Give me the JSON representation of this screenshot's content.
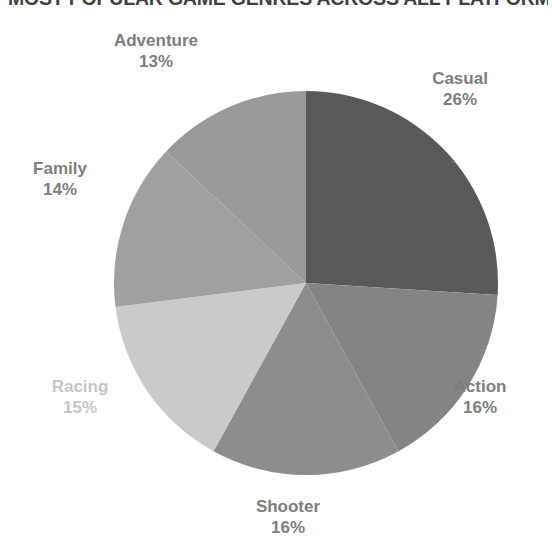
{
  "chart_data": {
    "type": "pie",
    "title": "MOST POPULAR GAME GENRES ACROSS ALL PLATFORMS",
    "xlabel": "",
    "ylabel": "",
    "legend": "none",
    "grid": false,
    "start_angle_deg": 0,
    "direction": "clockwise",
    "categories": [
      "Casual",
      "Action",
      "Shooter",
      "Racing",
      "Family",
      "Adventure"
    ],
    "values": [
      26,
      16,
      16,
      15,
      14,
      13
    ],
    "value_unit": "%",
    "slices": [
      {
        "label": "Casual",
        "value": 26,
        "display": "26%",
        "color": "#59595b",
        "label_color": "#7d7d7f"
      },
      {
        "label": "Action",
        "value": 16,
        "display": "16%",
        "color": "#848486",
        "label_color": "#7d7d7f"
      },
      {
        "label": "Shooter",
        "value": 16,
        "display": "16%",
        "color": "#8d8d8f",
        "label_color": "#7d7d7f"
      },
      {
        "label": "Racing",
        "value": 15,
        "display": "15%",
        "color": "#cacacb",
        "label_color": "#c6c6c7"
      },
      {
        "label": "Family",
        "value": 14,
        "display": "14%",
        "color": "#a0a0a2",
        "label_color": "#7d7d7f"
      },
      {
        "label": "Adventure",
        "value": 13,
        "display": "13%",
        "color": "#9a9a9c",
        "label_color": "#7d7d7f"
      }
    ]
  },
  "labels": {
    "casual": {
      "name": "Casual",
      "pct": "26%"
    },
    "action": {
      "name": "Action",
      "pct": "16%"
    },
    "shooter": {
      "name": "Shooter",
      "pct": "16%"
    },
    "racing": {
      "name": "Racing",
      "pct": "15%"
    },
    "family": {
      "name": "Family",
      "pct": "14%"
    },
    "adventure": {
      "name": "Adventure",
      "pct": "13%"
    }
  },
  "geometry": {
    "center_x": 306,
    "center_y": 283,
    "radius": 192
  }
}
